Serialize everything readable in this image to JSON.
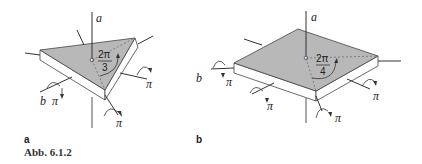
{
  "figure": {
    "caption": "Abb. 6.1.2",
    "panels": [
      {
        "label": "a",
        "shape": "triangular plate",
        "main_axis_label": "a",
        "secondary_axis_label": "b",
        "rotation_angle": {
          "numerator": "2π",
          "denominator": "3"
        },
        "secondary_rotations": [
          "π",
          "π",
          "π"
        ]
      },
      {
        "label": "b",
        "shape": "square plate",
        "main_axis_label": "a",
        "secondary_axis_label": "b",
        "rotation_angle": {
          "numerator": "2π",
          "denominator": "4"
        },
        "secondary_rotations": [
          "π",
          "π",
          "π",
          "π"
        ]
      }
    ],
    "colors": {
      "face": "#b8b8b8",
      "side": "#ffffff",
      "line": "#333333"
    }
  }
}
